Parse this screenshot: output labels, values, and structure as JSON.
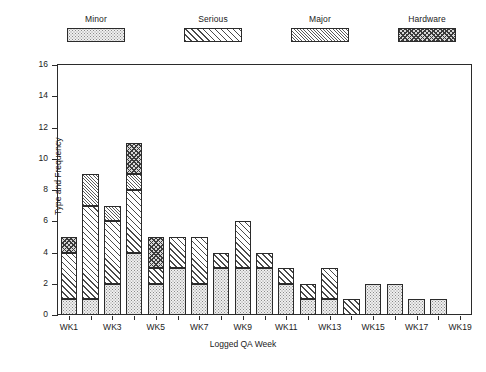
{
  "legend": {
    "items": [
      {
        "label": "Minor",
        "key": "minor",
        "pattern": "dotted-stipple"
      },
      {
        "label": "Serious",
        "key": "serious",
        "pattern": "diagonal-hatch"
      },
      {
        "label": "Major",
        "key": "major",
        "pattern": "dense-diagonal-hatch"
      },
      {
        "label": "Hardware",
        "key": "hardware",
        "pattern": "checkerboard"
      }
    ]
  },
  "chart_data": {
    "type": "bar",
    "stacked": true,
    "title": "",
    "xlabel": "Logged QA Week",
    "ylabel": "Type and Frequency",
    "ylim": [
      0,
      16
    ],
    "ytick_step": 2,
    "yticks": [
      0,
      2,
      4,
      6,
      8,
      10,
      12,
      14,
      16
    ],
    "grid": false,
    "legend_position": "top",
    "categories": [
      "WK1",
      "WK2",
      "WK3",
      "WK4",
      "WK5",
      "WK6",
      "WK7",
      "WK8",
      "WK9",
      "WK10",
      "WK11",
      "WK12",
      "WK13",
      "WK14",
      "WK15",
      "WK16",
      "WK17",
      "WK18",
      "WK19"
    ],
    "xtick_labels": [
      "WK1",
      "",
      "WK3",
      "",
      "WK5",
      "",
      "WK7",
      "",
      "WK9",
      "",
      "WK11",
      "",
      "WK13",
      "",
      "WK15",
      "",
      "WK17",
      "",
      "WK19"
    ],
    "series": [
      {
        "name": "Minor",
        "values": [
          1,
          1,
          2,
          4,
          2,
          3,
          2,
          3,
          3,
          3,
          2,
          1,
          1,
          0,
          2,
          2,
          1,
          1,
          0
        ]
      },
      {
        "name": "Serious",
        "values": [
          3,
          6,
          4,
          4,
          1,
          2,
          3,
          1,
          3,
          1,
          1,
          1,
          2,
          1,
          0,
          0,
          0,
          0,
          0
        ]
      },
      {
        "name": "Major",
        "values": [
          0,
          2,
          1,
          1,
          0,
          0,
          0,
          0,
          0,
          0,
          0,
          0,
          0,
          0,
          0,
          0,
          0,
          0,
          0
        ]
      },
      {
        "name": "Hardware",
        "values": [
          1,
          0,
          0,
          2,
          2,
          0,
          0,
          0,
          0,
          0,
          0,
          0,
          0,
          0,
          0,
          0,
          0,
          0,
          0
        ]
      }
    ],
    "totals": [
      5,
      9,
      7,
      11,
      5,
      5,
      5,
      4,
      6,
      4,
      3,
      2,
      3,
      1,
      2,
      2,
      1,
      1,
      0
    ]
  }
}
